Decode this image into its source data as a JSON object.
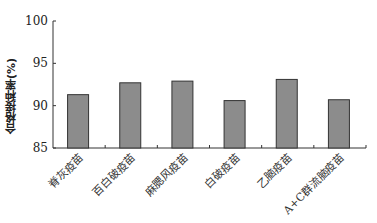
{
  "chart_data": {
    "type": "bar",
    "title": "",
    "xlabel": "",
    "ylabel": "合格接种率(%)",
    "categories": [
      "脊灰疫苗",
      "百白破疫苗",
      "麻腮风疫苗",
      "白破疫苗",
      "乙脑疫苗",
      "A+C群流脑疫苗"
    ],
    "values": [
      91.3,
      92.7,
      92.9,
      90.6,
      93.1,
      90.7
    ],
    "ylim": [
      85,
      100
    ],
    "yticks": [
      85,
      90,
      95,
      100
    ],
    "grid": false,
    "legend": null,
    "bar_color": "#8c8c8c",
    "bar_edge_color": "#333333"
  }
}
